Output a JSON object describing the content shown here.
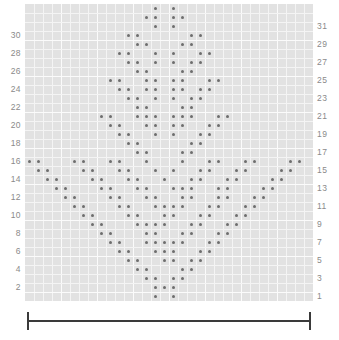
{
  "chart_data": {
    "type": "heatmap",
    "title": "",
    "xlabel": "",
    "ylabel": "",
    "columns": 32,
    "rows": 33,
    "grid_color": "#e2e2e2",
    "gridline_color": "#f4f4f4",
    "dot_color": "#6d6d6d",
    "label_color": "#8a8a8a",
    "bracket_color": "#3a3a3a",
    "legend": [],
    "axis_left_ticks": [
      "30",
      "28",
      "26",
      "24",
      "22",
      "20",
      "18",
      "16",
      "14",
      "12",
      "10",
      "8",
      "6",
      "4",
      "2"
    ],
    "axis_right_ticks": [
      "31",
      "29",
      "27",
      "25",
      "23",
      "21",
      "19",
      "17",
      "15",
      "13",
      "11",
      "9",
      "7",
      "5",
      "3",
      "1"
    ],
    "row_numbers_left_rows": [
      30,
      28,
      26,
      24,
      22,
      20,
      18,
      16,
      14,
      12,
      10,
      8,
      6,
      4,
      2
    ],
    "row_numbers_right_rows": [
      31,
      29,
      27,
      25,
      23,
      21,
      19,
      17,
      15,
      13,
      11,
      9,
      7,
      5,
      3,
      1
    ],
    "marked_cells": [
      {
        "row": 33,
        "cols": [
          15,
          17
        ]
      },
      {
        "row": 32,
        "cols": [
          14,
          15,
          17,
          18
        ]
      },
      {
        "row": 31,
        "cols": [
          15,
          17
        ]
      },
      {
        "row": 30,
        "cols": [
          12,
          13,
          19,
          20
        ]
      },
      {
        "row": 29,
        "cols": [
          13,
          14,
          18,
          19
        ]
      },
      {
        "row": 28,
        "cols": [
          11,
          12,
          15,
          17,
          20,
          21
        ]
      },
      {
        "row": 27,
        "cols": [
          12,
          13,
          15,
          17,
          19,
          20
        ]
      },
      {
        "row": 26,
        "cols": [
          13,
          14,
          18,
          19
        ]
      },
      {
        "row": 25,
        "cols": [
          10,
          11,
          14,
          15,
          17,
          18,
          21,
          22
        ]
      },
      {
        "row": 24,
        "cols": [
          11,
          12,
          14,
          15,
          17,
          18,
          20,
          21
        ]
      },
      {
        "row": 23,
        "cols": [
          12,
          13,
          15,
          17,
          19,
          20
        ]
      },
      {
        "row": 22,
        "cols": [
          13,
          14,
          18,
          19
        ]
      },
      {
        "row": 21,
        "cols": [
          9,
          10,
          13,
          14,
          15,
          17,
          18,
          19,
          22,
          23
        ]
      },
      {
        "row": 20,
        "cols": [
          10,
          11,
          14,
          15,
          17,
          18,
          21,
          22
        ]
      },
      {
        "row": 19,
        "cols": [
          11,
          12,
          15,
          17,
          20,
          21
        ]
      },
      {
        "row": 18,
        "cols": [
          12,
          13,
          19,
          20
        ]
      },
      {
        "row": 17,
        "cols": [
          13,
          14,
          18,
          19
        ]
      },
      {
        "row": 16,
        "cols": [
          1,
          2,
          6,
          7,
          10,
          11,
          14,
          18,
          21,
          22,
          25,
          26,
          30,
          31
        ]
      },
      {
        "row": 15,
        "cols": [
          2,
          3,
          7,
          8,
          11,
          12,
          15,
          17,
          20,
          21,
          24,
          25,
          29,
          30
        ]
      },
      {
        "row": 14,
        "cols": [
          3,
          4,
          8,
          9,
          12,
          13,
          16,
          19,
          20,
          23,
          24,
          28,
          29
        ]
      },
      {
        "row": 13,
        "cols": [
          4,
          5,
          9,
          10,
          13,
          14,
          17,
          18,
          19,
          22,
          23,
          27,
          28
        ]
      },
      {
        "row": 12,
        "cols": [
          5,
          6,
          10,
          11,
          14,
          15,
          18,
          19,
          22,
          23,
          26,
          27
        ]
      },
      {
        "row": 11,
        "cols": [
          6,
          7,
          11,
          12,
          15,
          16,
          17,
          18,
          21,
          22,
          25,
          26
        ]
      },
      {
        "row": 10,
        "cols": [
          7,
          8,
          12,
          13,
          16,
          17,
          20,
          21,
          24,
          25
        ]
      },
      {
        "row": 9,
        "cols": [
          8,
          9,
          13,
          14,
          15,
          16,
          19,
          20,
          23,
          24
        ]
      },
      {
        "row": 8,
        "cols": [
          9,
          10,
          14,
          15,
          18,
          19,
          22,
          23
        ]
      },
      {
        "row": 7,
        "cols": [
          10,
          11,
          14,
          15,
          16,
          17,
          18,
          21,
          22
        ]
      },
      {
        "row": 6,
        "cols": [
          11,
          12,
          15,
          16,
          17,
          20,
          21
        ]
      },
      {
        "row": 5,
        "cols": [
          12,
          13,
          16,
          17,
          19,
          20
        ]
      },
      {
        "row": 4,
        "cols": [
          13,
          14,
          18,
          19
        ]
      },
      {
        "row": 3,
        "cols": [
          14,
          15,
          17,
          18
        ]
      },
      {
        "row": 2,
        "cols": [
          15,
          16,
          17
        ]
      },
      {
        "row": 1,
        "cols": [
          15,
          17
        ]
      }
    ]
  },
  "bracket": {
    "label": "",
    "span_start_col": 1,
    "span_end_col": 32
  }
}
